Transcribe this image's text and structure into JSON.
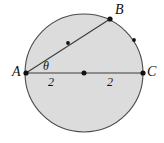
{
  "figure": {
    "canvas": {
      "width": 164,
      "height": 143,
      "background": "#ffffff"
    },
    "colors": {
      "circle_fill": "#dcdcdc",
      "circle_stroke": "#4a4a4a",
      "line_stroke": "#3c3c3c",
      "point_fill": "#111111",
      "label_color": "#111111"
    },
    "circle": {
      "center_x": 84,
      "center_y": 73,
      "radius": 59
    },
    "points": [
      {
        "id": "A",
        "label": "A",
        "x": 26,
        "y": 73,
        "label_x": 12,
        "label_y": 65
      },
      {
        "id": "B",
        "label": "B",
        "x": 110,
        "y": 19,
        "label_x": 115,
        "label_y": 3
      },
      {
        "id": "C",
        "label": "C",
        "x": 143,
        "y": 73,
        "label_x": 147,
        "label_y": 65
      },
      {
        "id": "O",
        "label": "",
        "x": 84,
        "y": 73,
        "label_x": 0,
        "label_y": 0
      },
      {
        "id": "M",
        "label": "",
        "x": 68,
        "y": 43,
        "label_x": 0,
        "label_y": 0
      },
      {
        "id": "Arc",
        "label": "",
        "x": 134,
        "y": 40,
        "label_x": 0,
        "label_y": 0
      }
    ],
    "segments": [
      {
        "id": "AC",
        "from": "A",
        "to": "C",
        "kind": "diameter"
      },
      {
        "id": "AB",
        "from": "A",
        "to": "B",
        "kind": "chord"
      }
    ],
    "angle": {
      "symbol": "θ",
      "vertex": "A",
      "between": [
        "AB",
        "AC"
      ],
      "label_x": 43,
      "label_y": 60
    },
    "measures": [
      {
        "id": "left-measure",
        "value": "2",
        "segment": "AO",
        "label_x": 48,
        "label_y": 76
      },
      {
        "id": "right-measure",
        "value": "2",
        "segment": "OC",
        "label_x": 107,
        "label_y": 76
      }
    ]
  }
}
